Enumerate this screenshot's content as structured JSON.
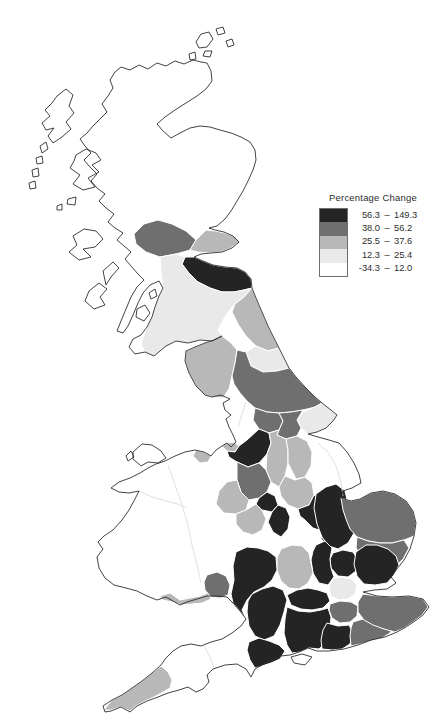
{
  "page": {
    "background": "#ffffff"
  },
  "legend": {
    "title": "Percentage Change"
  },
  "chart_data": {
    "type": "choropleth",
    "title": "Percentage Change",
    "geography": "Great Britain counties",
    "legend_position": "upper-right",
    "classes": [
      {
        "min": "56.3",
        "max": "149.3",
        "color": "#242424"
      },
      {
        "min": "38.0",
        "max": "56.2",
        "color": "#6f6f6f"
      },
      {
        "min": "25.5",
        "max": "37.6",
        "color": "#b8b8b8"
      },
      {
        "min": "12.3",
        "max": "25.4",
        "color": "#e9e9e9"
      },
      {
        "min": "-34.3",
        "max": "12.0",
        "color": "#ffffff"
      }
    ],
    "regions": [
      {
        "name": "lothian-borders-east",
        "class": 0
      },
      {
        "name": "cheshire-greater-manchester",
        "class": 0
      },
      {
        "name": "west-midlands",
        "class": 0
      },
      {
        "name": "warwickshire",
        "class": 0
      },
      {
        "name": "northamptonshire",
        "class": 0
      },
      {
        "name": "cambridgeshire",
        "class": 0
      },
      {
        "name": "hertfordshire",
        "class": 0
      },
      {
        "name": "essex",
        "class": 0
      },
      {
        "name": "buckinghamshire",
        "class": 0
      },
      {
        "name": "gloucestershire",
        "class": 0
      },
      {
        "name": "wiltshire",
        "class": 0
      },
      {
        "name": "berkshire",
        "class": 0
      },
      {
        "name": "hampshire",
        "class": 0
      },
      {
        "name": "west-sussex",
        "class": 0
      },
      {
        "name": "dorset",
        "class": 0
      },
      {
        "name": "central-scotland-stirling",
        "class": 1
      },
      {
        "name": "north-yorkshire",
        "class": 1
      },
      {
        "name": "west-yorkshire",
        "class": 1
      },
      {
        "name": "south-yorkshire",
        "class": 1
      },
      {
        "name": "staffordshire",
        "class": 1
      },
      {
        "name": "bedfordshire",
        "class": 1
      },
      {
        "name": "norfolk",
        "class": 1
      },
      {
        "name": "suffolk",
        "class": 1
      },
      {
        "name": "surrey",
        "class": 1
      },
      {
        "name": "east-sussex",
        "class": 1
      },
      {
        "name": "kent",
        "class": 1
      },
      {
        "name": "gwent",
        "class": 1
      },
      {
        "name": "fife",
        "class": 2
      },
      {
        "name": "northumberland",
        "class": 2
      },
      {
        "name": "cumbria",
        "class": 2
      },
      {
        "name": "merseyside",
        "class": 2
      },
      {
        "name": "derbyshire",
        "class": 2
      },
      {
        "name": "nottinghamshire",
        "class": 2
      },
      {
        "name": "shropshire",
        "class": 2
      },
      {
        "name": "worcestershire",
        "class": 2
      },
      {
        "name": "leicestershire",
        "class": 2
      },
      {
        "name": "oxfordshire",
        "class": 2
      },
      {
        "name": "cornwall",
        "class": 2
      },
      {
        "name": "south-glamorgan",
        "class": 2
      },
      {
        "name": "north-west-wales",
        "class": 2
      },
      {
        "name": "southern-scotland",
        "class": 3
      },
      {
        "name": "durham",
        "class": 3
      },
      {
        "name": "east-riding",
        "class": 3
      },
      {
        "name": "greater-london",
        "class": 3
      },
      {
        "name": "scottish-highlands-islands",
        "class": 4
      },
      {
        "name": "lancashire",
        "class": 4
      },
      {
        "name": "lincolnshire",
        "class": 4
      },
      {
        "name": "wales-central",
        "class": 4
      },
      {
        "name": "herefordshire",
        "class": 4
      },
      {
        "name": "devon",
        "class": 4
      },
      {
        "name": "somerset",
        "class": 4
      },
      {
        "name": "isle-of-wight",
        "class": 4
      },
      {
        "name": "anglesey",
        "class": 4
      }
    ]
  },
  "map": {
    "size": {
      "w": 445,
      "h": 728
    },
    "land_fill": "#ffffff",
    "coast_stroke": "#2e2e2e",
    "boundary_stroke": "#ffffff",
    "faint_boundary_stroke": "#d8d8d8",
    "outlines": [
      {
        "name": "gb-mainland",
        "d": "M252,288 L256,298 262,312 268,326 274,338 279,348 284,358 289,368 296,377 305,387 314,396 322,403 331,410 337,415 333,421 326,428 317,432 308,434 318,437 329,440 339,443 347,452 354,463 359,474 361,483 352,488 343,491 341,498 351,501 360,499 371,493 383,491 395,494 406,501 413,511 416,523 414,536 410,549 404,560 397,569 391,577 396,583 387,589 374,590 363,592 377,596 392,597 409,596 423,599 429,607 423,615 415,621 406,627 397,632 385,637 371,640 358,645 344,649 329,651 317,651 308,648 299,652 290,655 281,656 271,660 262,665 255,669 251,677 246,669 237,664 225,665 213,669 207,675 209,682 203,689 196,692 188,687 179,690 168,693 158,697 147,701 137,706 130,712 121,707 111,711 105,712 103,706 112,700 122,695 132,688 142,681 152,673 161,665 166,658 173,651 181,646 191,644 201,646 211,642 222,639 232,633 241,626 246,619 240,611 233,603 227,597 217,596 207,596 197,599 187,602 180,605 173,601 166,597 157,600 147,596 137,591 126,588 114,585 105,578 99,568 97,557 103,549 98,542 104,536 113,530 122,520 129,510 135,499 139,491 129,493 119,492 111,488 119,482 130,478 140,473 148,468 156,464 165,461 175,456 185,452 195,450 204,452 211,456 216,450 222,446 227,443 231,447 236,442 233,435 229,427 226,419 231,415 225,410 223,403 230,399 221,395 212,397 205,395 196,386 189,373 185,361 186,351 195,347 205,343 214,340 222,336 212,341 200,340 188,343 176,341 166,346 154,356 145,352 135,354 129,347 133,339 141,335 147,327 152,317 155,307 159,296 163,288 159,281 150,285 143,293 138,303 133,315 128,326 123,333 117,331 121,321 126,309 131,297 137,287 144,280 138,274 131,266 125,259 131,252 124,246 117,240 123,233 115,228 108,222 114,214 106,208 99,201 105,194 97,188 91,181 97,174 90,167 84,160 91,153 85,146 80,139 87,133 93,126 100,119 107,112 102,104 108,96 113,88 110,80 115,72 121,67 130,70 139,65 148,69 157,63 166,66 175,61 184,64 193,60 201,62 207,63 211,71 212,81 206,89 197,96 186,103 175,110 165,117 157,124 163,131 171,138 180,133 190,128 200,126 210,127 220,130 231,133 241,137 250,142 255,150 256,160 253,170 248,181 243,191 237,201 231,211 225,219 217,226 209,228 215,230 224,232 233,236 239,242 232,248 222,252 211,253 201,254 194,257 203,261 213,265 225,267 237,268 245,272 251,279 Z"
      },
      {
        "name": "orkney-1",
        "d": "M196,42 L201,34 209,32 213,39 207,47 199,48 Z"
      },
      {
        "name": "orkney-2",
        "d": "M216,29 L223,27 225,33 218,35 Z"
      },
      {
        "name": "orkney-3",
        "d": "M226,41 L232,39 234,45 228,47 Z"
      },
      {
        "name": "orkney-4",
        "d": "M205,51 L212,51 210,57 203,56 Z"
      },
      {
        "name": "orkney-5",
        "d": "M189,54 L195,52 196,59 190,60 Z"
      },
      {
        "name": "lewis-harris",
        "d": "M57,96 L66,89 73,95 69,106 74,113 66,122 71,129 62,137 53,143 48,136 54,128 46,130 42,123 50,116 45,110 52,103 Z"
      },
      {
        "name": "uist-1",
        "d": "M40,146 L46,142 48,149 42,153 Z"
      },
      {
        "name": "uist-2",
        "d": "M36,158 L42,156 43,163 37,164 Z"
      },
      {
        "name": "uist-3",
        "d": "M32,170 L38,168 39,176 33,177 Z"
      },
      {
        "name": "uist-4",
        "d": "M29,183 L35,181 36,188 30,189 Z"
      },
      {
        "name": "skye",
        "d": "M76,155 L86,149 96,153 101,160 92,165 99,172 88,178 95,187 83,190 73,184 80,175 70,168 74,161 Z"
      },
      {
        "name": "small-isle-1",
        "d": "M68,199 L76,197 75,205 67,204 Z"
      },
      {
        "name": "small-isle-2",
        "d": "M57,206 L62,204 62,210 57,210 Z"
      },
      {
        "name": "mull",
        "d": "M73,236 L84,229 96,231 103,239 95,247 83,249 91,257 79,260 69,252 77,245 Z"
      },
      {
        "name": "jura",
        "d": "M103,271 L113,262 119,268 111,277 106,285 Z"
      },
      {
        "name": "islay",
        "d": "M89,291 L99,283 107,289 100,297 105,305 94,309 85,301 Z"
      },
      {
        "name": "arran",
        "d": "M137,309 L145,305 150,313 144,321 136,317 Z"
      },
      {
        "name": "bute",
        "d": "M149,293 L155,289 157,296 151,299 Z"
      },
      {
        "name": "anglesey",
        "d": "M133,452 L142,444 152,445 161,451 166,458 158,463 148,462 141,466 133,459 Z"
      },
      {
        "name": "holy-island",
        "d": "M126,456 L131,451 134,457 128,461 Z"
      },
      {
        "name": "isle-of-wight",
        "d": "M291,657 L302,654 312,657 305,665 294,663 Z"
      }
    ],
    "colored_regions": [
      {
        "name": "central-scotland-stirling",
        "class": 1,
        "points": "134,234 144,224 158,220 172,224 186,231 196,240 190,250 176,254 160,257 146,252 136,244"
      },
      {
        "name": "fife",
        "class": 2,
        "points": "196,240 206,230 215,231 225,233 236,237 239,242 231,248 221,252 209,253 198,252 190,250"
      },
      {
        "name": "lothian-borders-east",
        "class": 0,
        "points": "185,257 194,257 203,261 213,265 225,267 237,268 245,272 251,279 252,288 244,290 234,292 222,292 210,288 198,282 188,272 182,264"
      },
      {
        "name": "southern-scotland",
        "class": 3,
        "points": "160,257 176,254 185,257 182,264 188,272 198,282 210,288 222,292 234,292 244,290 252,288 244,297 235,304 228,312 222,322 218,330 222,336 212,341 200,340 188,343 176,341 166,346 154,356 145,352 141,344 147,327 152,317 155,307 159,296 163,288 161,272"
      },
      {
        "name": "northumberland",
        "class": 2,
        "points": "252,288 256,298 262,312 268,326 274,338 279,348 268,351 256,346 246,336 238,324 232,312 235,304 244,297"
      },
      {
        "name": "durham",
        "class": 3,
        "points": "279,348 284,358 289,368 277,371 263,372 251,366 246,352 256,346 268,351"
      },
      {
        "name": "cumbria",
        "class": 2,
        "points": "186,351 195,347 205,343 214,340 222,336 230,342 237,350 235,363 232,376 229,389 223,398 212,397 205,395 196,386 189,373 185,361"
      },
      {
        "name": "north-yorkshire",
        "class": 1,
        "points": "246,352 251,366 263,372 277,371 289,368 296,377 305,387 314,396 322,403 315,407 303,410 291,412 279,413 267,412 255,408 247,401 240,393 234,384 232,376 235,363 237,350"
      },
      {
        "name": "east-riding",
        "class": 3,
        "points": "322,403 331,410 337,415 333,421 326,428 317,432 308,434 301,428 297,420 303,412 315,407"
      },
      {
        "name": "west-yorkshire",
        "class": 1,
        "points": "255,408 267,412 279,413 283,421 279,430 269,433 259,429 253,420"
      },
      {
        "name": "south-yorkshire",
        "class": 1,
        "points": "279,413 291,412 303,410 297,420 301,428 297,436 286,439 277,435 279,430 283,421"
      },
      {
        "name": "merseyside",
        "class": 2,
        "points": "222,446 227,443 234,442 239,446 235,452 227,451"
      },
      {
        "name": "cheshire-greater-manchester",
        "class": 0,
        "points": "227,451 235,452 239,446 247,440 259,429 269,433 271,443 267,454 259,463 248,467 237,462 229,457"
      },
      {
        "name": "derbyshire",
        "class": 2,
        "points": "269,433 279,430 277,435 286,439 288,450 288,463 285,476 279,487 271,482 266,470 267,454 271,443"
      },
      {
        "name": "nottinghamshire",
        "class": 2,
        "points": "286,439 297,436 307,441 312,452 311,466 305,477 296,479 288,463 288,450"
      },
      {
        "name": "staffordshire",
        "class": 1,
        "points": "237,462 248,467 259,463 266,470 271,482 267,492 259,498 249,500 241,492 237,480"
      },
      {
        "name": "shropshire",
        "class": 2,
        "points": "216,504 219,491 227,482 237,480 241,492 249,500 246,510 236,514 224,513"
      },
      {
        "name": "west-midlands",
        "class": 0,
        "points": "259,498 267,492 275,496 278,505 272,512 262,510 256,504"
      },
      {
        "name": "warwickshire",
        "class": 0,
        "points": "272,512 278,505 286,508 290,517 288,529 281,537 273,532 268,522"
      },
      {
        "name": "worcestershire",
        "class": 2,
        "points": "236,514 246,510 256,504 262,510 266,519 262,530 253,535 243,532 236,524"
      },
      {
        "name": "leicestershire",
        "class": 2,
        "points": "279,487 285,476 295,480 305,477 312,483 314,495 309,505 298,509 288,505 281,496"
      },
      {
        "name": "northamptonshire",
        "class": 0,
        "points": "298,509 309,505 314,495 322,499 330,506 334,515 330,524 322,531 313,528 305,520 300,516"
      },
      {
        "name": "bedfordshire",
        "class": 1,
        "points": "322,531 330,524 338,528 341,537 336,546 327,545 321,539"
      },
      {
        "name": "cambridgeshire",
        "class": 0,
        "points": "316,494 326,487 336,484 345,491 348,504 352,519 354,533 348,543 338,549 329,546 322,537 317,524 314,508"
      },
      {
        "name": "norfolk",
        "class": 1,
        "points": "351,501 360,499 371,493 383,491 395,494 406,501 413,511 416,523 414,536 404,540 392,543 380,543 368,541 357,537 350,529 346,519 343,510 341,498"
      },
      {
        "name": "suffolk",
        "class": 1,
        "points": "357,537 368,541 380,543 392,543 404,540 409,548 403,559 396,566 385,561 373,559 362,556 356,548"
      },
      {
        "name": "hertfordshire",
        "class": 0,
        "points": "333,553 343,550 353,552 358,560 356,571 348,577 338,576 331,568 330,559"
      },
      {
        "name": "essex",
        "class": 0,
        "points": "356,552 366,545 377,545 388,549 396,556 399,565 394,575 387,583 375,585 364,584 357,576 354,564"
      },
      {
        "name": "buckinghamshire",
        "class": 0,
        "points": "316,545 325,541 332,548 330,559 331,568 334,577 328,585 319,583 313,573 311,560 313,551"
      },
      {
        "name": "oxfordshire",
        "class": 2,
        "points": "281,549 292,545 302,546 309,553 311,563 313,573 308,583 299,589 289,588 281,581 277,570 277,558"
      },
      {
        "name": "gloucestershire",
        "class": 0,
        "points": "236,552 247,547 258,548 268,551 276,557 277,570 272,580 264,587 254,592 247,600 242,610 246,618 240,611 233,603 231,594 234,580 233,566"
      },
      {
        "name": "wiltshire",
        "class": 0,
        "points": "252,594 262,589 273,586 283,590 287,600 284,612 280,625 274,636 264,640 255,636 249,626 247,612 248,601"
      },
      {
        "name": "berkshire",
        "class": 0,
        "points": "287,595 297,590 308,588 318,590 327,593 330,601 323,608 312,610 301,609 291,605"
      },
      {
        "name": "hampshire",
        "class": 0,
        "points": "287,607 298,611 310,612 321,610 328,608 331,617 330,629 327,641 319,649 309,648 300,652 292,653 287,645 284,633 285,619"
      },
      {
        "name": "surrey",
        "class": 1,
        "points": "330,604 340,601 351,602 358,606 357,616 350,622 340,623 332,618 329,610"
      },
      {
        "name": "west-sussex",
        "class": 0,
        "points": "327,623 338,626 349,625 353,633 350,644 342,649 332,650 322,649 321,640 323,630"
      },
      {
        "name": "east-sussex",
        "class": 1,
        "points": "353,622 363,619 374,618 385,620 393,625 390,633 382,638 371,641 360,644 351,646 350,636 351,628"
      },
      {
        "name": "kent",
        "class": 1,
        "points": "363,594 377,596 392,597 409,596 423,599 428,607 422,615 413,622 404,628 395,632 384,629 373,625 364,620 358,612 358,602"
      },
      {
        "name": "greater-london",
        "class": 3,
        "points": "333,578 343,577 352,579 357,585 355,594 348,599 339,600 331,596 329,587"
      },
      {
        "name": "dorset",
        "class": 0,
        "points": "249,642 259,638 269,641 279,645 285,651 280,659 271,663 262,666 255,668 250,660 247,650"
      },
      {
        "name": "cornwall",
        "class": 2,
        "points": "104,710 112,700 122,695 132,688 142,681 152,673 161,666 168,672 172,680 170,688 163,692 154,697 145,701 136,706 130,711 121,707 111,710"
      },
      {
        "name": "south-glamorgan",
        "class": 2,
        "points": "160,596 170,593 180,600 190,598 200,596 208,593 211,599 202,603 192,604 182,605 172,602 163,600"
      },
      {
        "name": "gwent",
        "class": 1,
        "points": "207,575 217,572 226,576 230,585 228,595 220,598 211,597 205,590 204,582"
      },
      {
        "name": "north-west-wales",
        "class": 2,
        "points": "196,450 204,452 211,456 208,462 200,463 193,456"
      }
    ],
    "faint_boundaries": [
      "M168,465 L175,485 182,505 188,525 192,545 197,565 201,583",
      "M139,491 L152,497 166,501 178,504 186,508",
      "M204,646 L210,657 214,668",
      "M318,443 L328,452 336,466 341,482 343,496",
      "M246,402 L242,414 238,427"
    ]
  }
}
